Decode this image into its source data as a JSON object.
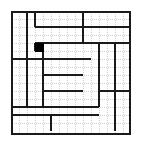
{
  "puzzle": {
    "title": "Rectangle Partition Grid",
    "type": "grid-partition-puzzle",
    "columns": 15,
    "rows": 15,
    "cell_size_px": 8,
    "origin_px": {
      "x": 11,
      "y": 11
    },
    "colors": {
      "wall": "#1a1a1a",
      "lattice": "#d2d2d2",
      "fill": "#000000",
      "background": "#ffffff"
    },
    "outer_border": {
      "label": "outer-border",
      "x": 0,
      "y": 0,
      "w": 15,
      "h": 15
    },
    "filled_cells": [
      {
        "label": "black-cell",
        "col": 3,
        "row": 4
      }
    ],
    "horizontal_walls": [
      {
        "label": "wall-h-top-mid-a",
        "col": 3,
        "row": 2,
        "span": 6
      },
      {
        "label": "wall-h-top-right-a",
        "col": 9,
        "row": 2,
        "span": 6
      },
      {
        "label": "wall-h-upper-mid",
        "col": 3,
        "row": 4,
        "span": 6
      },
      {
        "label": "wall-h-upper-right",
        "col": 9,
        "row": 4,
        "span": 6
      },
      {
        "label": "wall-h-black-bottom",
        "col": 3,
        "row": 5,
        "span": 1
      },
      {
        "label": "wall-h-center-band",
        "col": 0,
        "row": 6,
        "span": 10
      },
      {
        "label": "wall-h-mid-strip-a",
        "col": 4,
        "row": 8,
        "span": 5
      },
      {
        "label": "wall-h-mid-strip-b",
        "col": 4,
        "row": 10,
        "span": 5
      },
      {
        "label": "wall-h-right-lower",
        "col": 11,
        "row": 10,
        "span": 4
      },
      {
        "label": "wall-h-lower-band",
        "col": 0,
        "row": 12,
        "span": 11
      },
      {
        "label": "wall-h-bottom-left",
        "col": 0,
        "row": 13,
        "span": 5
      },
      {
        "label": "wall-h-bottom-right",
        "col": 5,
        "row": 13,
        "span": 6
      }
    ],
    "vertical_walls": [
      {
        "label": "wall-v-left-a",
        "col": 2,
        "row": 0,
        "span": 6
      },
      {
        "label": "wall-v-left-b",
        "col": 2,
        "row": 6,
        "span": 6
      },
      {
        "label": "wall-v-col4-top",
        "col": 3,
        "row": 0,
        "span": 2
      },
      {
        "label": "wall-v-col4-black",
        "col": 3,
        "row": 4,
        "span": 1
      },
      {
        "label": "wall-v-center-stem",
        "col": 4,
        "row": 4,
        "span": 8
      },
      {
        "label": "wall-v-top-right",
        "col": 9,
        "row": 0,
        "span": 4
      },
      {
        "label": "wall-v-right-inner",
        "col": 11,
        "row": 4,
        "span": 8
      },
      {
        "label": "wall-v-right-outer",
        "col": 13,
        "row": 4,
        "span": 11
      },
      {
        "label": "wall-v-bottom-mid",
        "col": 5,
        "row": 13,
        "span": 2
      }
    ]
  }
}
